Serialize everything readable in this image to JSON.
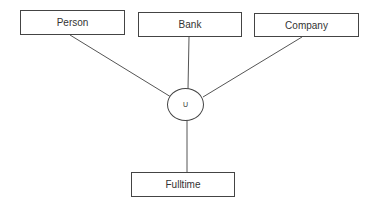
{
  "diagram": {
    "entities": [
      {
        "id": "person",
        "label": "Person"
      },
      {
        "id": "bank",
        "label": "Bank"
      },
      {
        "id": "company",
        "label": "Company"
      }
    ],
    "union_node": {
      "label": "U"
    },
    "subclass": {
      "label": "Fulltime"
    }
  }
}
